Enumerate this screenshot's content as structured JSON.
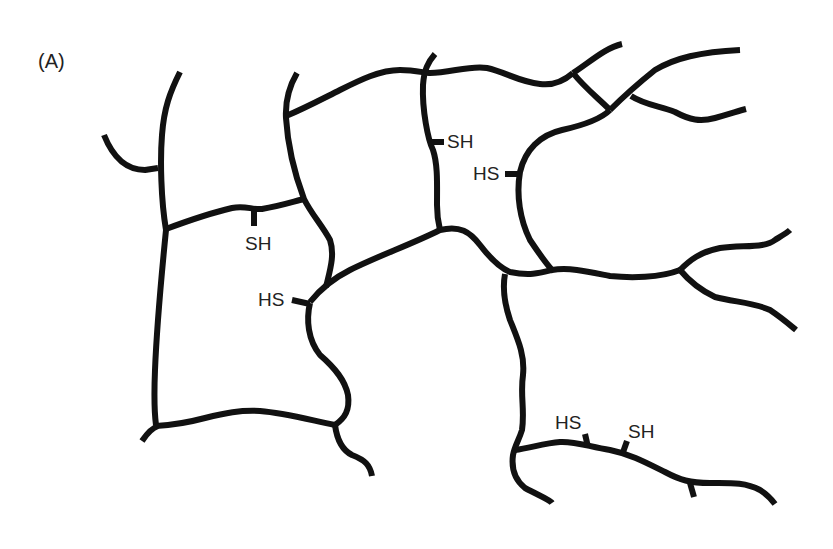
{
  "figure": {
    "panel_label": "(A)",
    "colors": {
      "strand": "#111111",
      "text": "#222222",
      "background": "#ffffff"
    },
    "thiol_labels": [
      {
        "id": "thiol-1",
        "text": "SH"
      },
      {
        "id": "thiol-2",
        "text": "HS"
      },
      {
        "id": "thiol-3",
        "text": "SH"
      },
      {
        "id": "thiol-4",
        "text": "HS"
      },
      {
        "id": "thiol-5",
        "text": "HS"
      },
      {
        "id": "thiol-6",
        "text": "SH"
      }
    ]
  }
}
